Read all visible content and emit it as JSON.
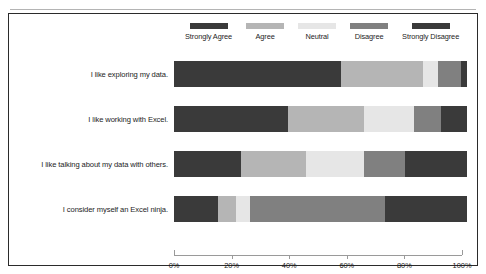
{
  "top_partial_text": "",
  "chart_data": {
    "type": "bar",
    "subtype": "stacked-horizontal-100-percent",
    "title": "",
    "xlabel": "",
    "ylabel": "",
    "xlim": [
      0,
      100
    ],
    "xticks": [
      0,
      20,
      40,
      60,
      80,
      100
    ],
    "xticklabels": [
      "0%",
      "20%",
      "40%",
      "60%",
      "80%",
      "100%"
    ],
    "grid": false,
    "legend_position": "top",
    "categories": [
      "I like exploring my data.",
      "I like working with Excel.",
      "I like talking about my data with others.",
      "I consider myself an Excel ninja."
    ],
    "series": [
      {
        "name": "Strongly Agree",
        "color": "#3a3a3a",
        "values": [
          57,
          39,
          23,
          15
        ]
      },
      {
        "name": "Agree",
        "color": "#b5b5b5",
        "values": [
          28,
          26,
          22,
          6
        ]
      },
      {
        "name": "Neutral",
        "color": "#e6e6e6",
        "values": [
          5,
          17,
          20,
          5
        ]
      },
      {
        "name": "Disagree",
        "color": "#808080",
        "values": [
          8,
          9,
          14,
          46
        ]
      },
      {
        "name": "Strongly Disagree",
        "color": "#3a3a3a",
        "values": [
          2,
          9,
          21,
          28
        ]
      }
    ]
  }
}
